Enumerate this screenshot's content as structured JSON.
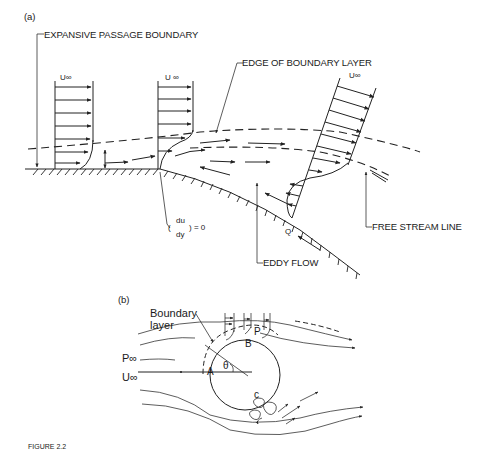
{
  "figure": {
    "panel_a_label": "(a)",
    "panel_b_label": "(b)",
    "caption_fragment": "FIGURE 2.2"
  },
  "panel_a": {
    "labels": {
      "expansive_passage_boundary": "EXPANSIVE PASSAGE BOUNDARY",
      "edge_of_boundary_layer": "EDGE OF BOUNDARY LAYER",
      "free_stream_line": "FREE STREAM LINE",
      "eddy_flow": "EDDY FLOW",
      "u_inf_1": "U∞",
      "u_inf_2": "U ∞",
      "u_inf_3": "U∞",
      "point_q": "Q",
      "du": "du",
      "dy": "dy",
      "eq_zero": ") = 0",
      "paren_open": "("
    }
  },
  "panel_b": {
    "labels": {
      "boundary_layer_1": "Boundary",
      "boundary_layer_2": "layer",
      "p_inf": "P∞",
      "u_inf": "U∞",
      "point_a": "A",
      "point_b": "B",
      "point_p": "P",
      "point_c": "c",
      "theta": "θ"
    }
  }
}
